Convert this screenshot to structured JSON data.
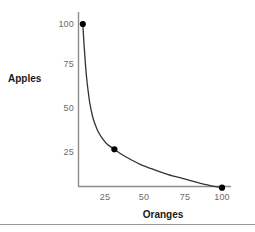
{
  "chart_data": {
    "type": "line",
    "title": "",
    "subtitle": "",
    "xlabel": "Oranges",
    "ylabel": "Apples",
    "xlim": [
      0,
      110
    ],
    "ylim": [
      0,
      110
    ],
    "xticks": [
      25,
      50,
      75,
      100
    ],
    "yticks": [
      25,
      50,
      75,
      100
    ],
    "xtick_labels": [
      "25",
      "50",
      "75",
      "100"
    ],
    "ytick_labels": [
      "25",
      "50",
      "75",
      "100"
    ],
    "grid": false,
    "legend": null,
    "annotations": [],
    "series": [
      {
        "name": "Production possibility frontier",
        "type": "line",
        "color": "#333333",
        "marker": "circle",
        "marker_color": "#000000",
        "curve": "hyperbola",
        "x": [
          3,
          25,
          100
        ],
        "y": [
          100,
          25,
          2
        ],
        "points": [
          {
            "label": "A",
            "x": 3,
            "y": 100
          },
          {
            "label": "B",
            "x": 25,
            "y": 25
          },
          {
            "label": "C",
            "x": 100,
            "y": 2
          }
        ],
        "path_x": [
          3,
          4,
          5,
          6,
          7,
          8,
          10,
          12,
          14,
          17,
          20,
          25,
          30,
          36,
          43,
          52,
          62,
          75,
          88,
          100
        ],
        "path_y": [
          100,
          86,
          74,
          65,
          58,
          52,
          44,
          39,
          35,
          31,
          28,
          25,
          22,
          19,
          16,
          13,
          10,
          7,
          4,
          2
        ]
      }
    ]
  },
  "axes": {
    "axis_color": "#8c8c8c",
    "tick_text_color": "#6b6b6b",
    "title_color": "#1a1a1a"
  },
  "figure": {
    "background": "#ffffff",
    "rule_color": "#9a9a9a"
  },
  "yticks": [
    {
      "label": "100",
      "value": 100
    },
    {
      "label": "75",
      "value": 75
    },
    {
      "label": "50",
      "value": 50
    },
    {
      "label": "25",
      "value": 25
    }
  ],
  "xticks": [
    {
      "label": "25",
      "value": 25
    },
    {
      "label": "50",
      "value": 50
    },
    {
      "label": "75",
      "value": 75
    },
    {
      "label": "100",
      "value": 100
    }
  ]
}
